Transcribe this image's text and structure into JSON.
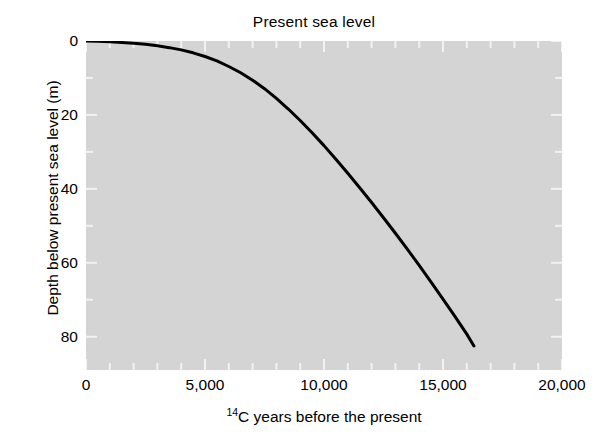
{
  "chart_data": {
    "type": "line",
    "title": "Present sea level",
    "xlabel_prefix": "14",
    "xlabel_rest": "C years before the present",
    "xlabel": "14C years before the present",
    "ylabel": "Depth below present sea level (m)",
    "xlim": [
      0,
      20000
    ],
    "ylim": [
      89,
      0
    ],
    "y_inverted": true,
    "grid": false,
    "legend": null,
    "background": "#d4d4d4",
    "line_color": "#000000",
    "line_width": 3,
    "xticks": [
      0,
      5000,
      10000,
      15000,
      20000
    ],
    "xtick_labels": [
      "0",
      "5,000",
      "10,000",
      "15,000",
      "20,000"
    ],
    "x_minor_tick_interval": 1000,
    "yticks": [
      0,
      20,
      40,
      60,
      80
    ],
    "ytick_labels": [
      "0",
      "20",
      "40",
      "60",
      "80"
    ],
    "y_minor_tick_interval": 10,
    "series": [
      {
        "name": "Sea level curve",
        "x": [
          0,
          500,
          1000,
          1500,
          2000,
          2500,
          3000,
          3500,
          4000,
          4500,
          5000,
          5500,
          6000,
          6500,
          7000,
          7500,
          8000,
          8500,
          9000,
          9500,
          10000,
          10500,
          11000,
          11500,
          12000,
          12500,
          13000,
          13500,
          14000,
          14500,
          15000,
          15500,
          16000,
          16300
        ],
        "y": [
          0.0,
          0.1,
          0.2,
          0.4,
          0.6,
          0.9,
          1.3,
          1.8,
          2.4,
          3.2,
          4.2,
          5.4,
          6.9,
          8.6,
          10.6,
          12.9,
          15.5,
          18.4,
          21.5,
          24.8,
          28.3,
          32.0,
          35.8,
          39.7,
          43.7,
          47.8,
          52.0,
          56.3,
          60.7,
          65.2,
          69.8,
          74.5,
          79.3,
          82.5
        ]
      }
    ]
  },
  "figure": {
    "title_text": "Present sea level"
  }
}
